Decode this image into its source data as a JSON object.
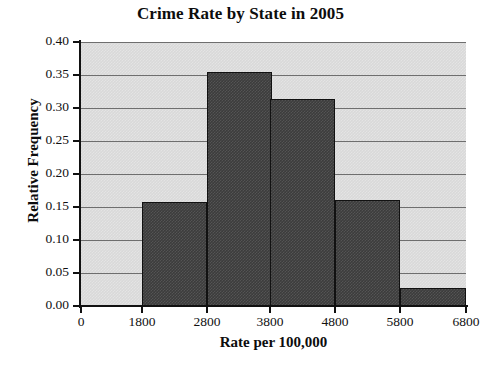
{
  "chart_data": {
    "type": "bar",
    "title": "Crime Rate by State in 2005",
    "xlabel": "Rate per 100,000",
    "ylabel": "Relative Frequency",
    "grid": true,
    "legend": false,
    "bin_edges": [
      1800,
      2800,
      3800,
      4800,
      5800,
      6800
    ],
    "categories": [
      "1800-2800",
      "2800-3800",
      "3800-4800",
      "4800-5800",
      "5800-6800"
    ],
    "values": [
      0.158,
      0.355,
      0.313,
      0.16,
      0.027
    ],
    "x_tick_labels": [
      "0",
      "1800",
      "2800",
      "3800",
      "4800",
      "5800",
      "6800"
    ],
    "x_tick_values": [
      0,
      1800,
      2800,
      3800,
      4800,
      5800,
      6800
    ],
    "y_tick_labels": [
      "0.00",
      "0.05",
      "0.10",
      "0.15",
      "0.20",
      "0.25",
      "0.30",
      "0.35",
      "0.40"
    ],
    "y_tick_values": [
      0.0,
      0.05,
      0.1,
      0.15,
      0.2,
      0.25,
      0.3,
      0.35,
      0.4
    ],
    "ylim": [
      0.0,
      0.4
    ],
    "xlim": [
      0,
      6800
    ],
    "axis_break": true,
    "colors": {
      "bar_fill": "#3c3c3c",
      "bar_edge": "#111111",
      "plot_background": "#d9d9d9",
      "gridline": "#6e6e6e",
      "axis": "#111111",
      "text": "#111111",
      "figure_background": "#ffffff"
    }
  }
}
